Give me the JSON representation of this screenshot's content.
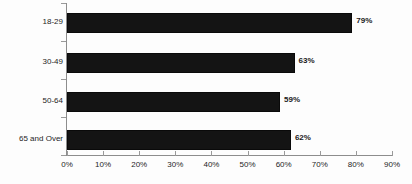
{
  "chart_data": {
    "type": "bar",
    "orientation": "horizontal",
    "title": "",
    "subtitle": "",
    "xlabel": "",
    "ylabel": "",
    "categories": [
      "18-29",
      "30-49",
      "50-64",
      "65 and Over"
    ],
    "values": [
      79,
      63,
      59,
      62
    ],
    "value_labels": [
      "79%",
      "63%",
      "59%",
      "62%"
    ],
    "xlim": [
      0,
      90
    ],
    "xtick_values": [
      0,
      10,
      20,
      30,
      40,
      50,
      60,
      70,
      80,
      90
    ],
    "xtick_labels": [
      "0%",
      "10%",
      "20%",
      "30%",
      "40%",
      "50%",
      "60%",
      "70%",
      "80%",
      "90%"
    ],
    "grid": false,
    "legend": null,
    "legend_position": "none",
    "series": [
      {
        "name": "",
        "values": [
          79,
          63,
          59,
          62
        ]
      }
    ],
    "colors": {
      "bar_fill": "#141414",
      "bar_edge": "#0a0a0a",
      "axis_line": "#8d8d8d",
      "tick_mark": "#9a9a9a",
      "text": "#1d1d1d",
      "value_text": "#1a1a1a",
      "background": "#fdfdfd"
    }
  }
}
